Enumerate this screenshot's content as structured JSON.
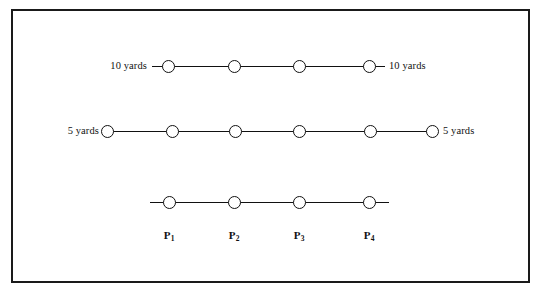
{
  "figure": {
    "background_color": "#ffffff",
    "stroke_color": "#111111",
    "frame": {
      "border_color": "#1a1a1a",
      "x": 11,
      "y": 9,
      "width": 519,
      "height": 274
    }
  },
  "chart_data": {
    "type": "diagram",
    "title": "",
    "subtitle": "",
    "xlabel": "",
    "ylabel": "",
    "rows": [
      {
        "id": "row-10-yards",
        "spacing_label": "10 yards",
        "left_label": "10 yards",
        "right_label": "10 yards",
        "node_count": 4,
        "y": 66,
        "line_start_x": 152,
        "line_end_x": 385,
        "node_x": [
          168,
          234,
          299,
          369
        ],
        "left_label_x": 147,
        "right_label_x": 389
      },
      {
        "id": "row-5-yards",
        "spacing_label": "5 yards",
        "left_label": "5 yards",
        "right_label": "5 yards",
        "node_count": 6,
        "y": 131,
        "line_start_x": 104,
        "line_end_x": 438,
        "node_x": [
          107,
          172,
          235,
          299,
          370,
          432
        ],
        "left_label_x": 99,
        "right_label_x": 443
      },
      {
        "id": "row-points",
        "spacing_label": "",
        "left_label": "",
        "right_label": "",
        "node_count": 4,
        "y": 202,
        "line_start_x": 150,
        "line_end_x": 389,
        "node_x": [
          169,
          234,
          299,
          369
        ],
        "left_label_x": null,
        "right_label_x": null
      }
    ],
    "point_labels": [
      {
        "base": "P",
        "subscript": "1",
        "text": "P1",
        "x": 169,
        "y": 230
      },
      {
        "base": "P",
        "subscript": "2",
        "text": "P2",
        "x": 234,
        "y": 230
      },
      {
        "base": "P",
        "subscript": "3",
        "text": "P3",
        "x": 299,
        "y": 230
      },
      {
        "base": "P",
        "subscript": "4",
        "text": "P4",
        "x": 369,
        "y": 230
      }
    ]
  }
}
